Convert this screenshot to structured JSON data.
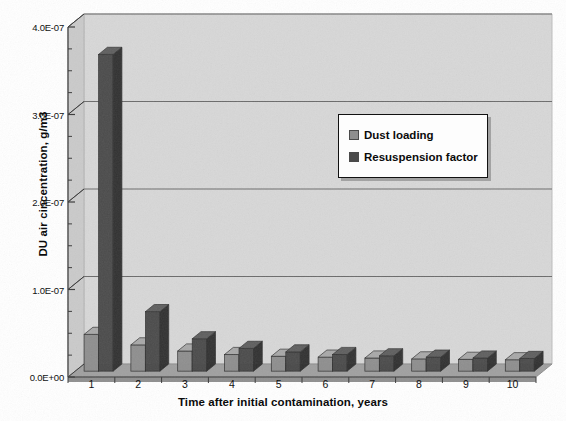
{
  "chart_data": {
    "type": "bar",
    "title": "",
    "xlabel": "Time after initial contamination, years",
    "ylabel": "DU air cincentration, g/m3",
    "categories": [
      "1",
      "2",
      "3",
      "4",
      "5",
      "6",
      "7",
      "8",
      "9",
      "10"
    ],
    "series": [
      {
        "name": "Dust loading",
        "color": "#8e8e8e",
        "values": [
          4.2e-08,
          3e-08,
          2.3e-08,
          1.9e-08,
          1.7e-08,
          1.6e-08,
          1.5e-08,
          1.4e-08,
          1.35e-08,
          1.3e-08
        ]
      },
      {
        "name": "Resuspension factor",
        "color": "#4a4a4a",
        "values": [
          3.62e-07,
          6.8e-08,
          3.7e-08,
          2.6e-08,
          2.2e-08,
          1.9e-08,
          1.75e-08,
          1.6e-08,
          1.5e-08,
          1.45e-08
        ]
      }
    ],
    "ylim": [
      0,
      4e-07
    ],
    "ytick_labels": [
      "4.0E-07",
      "3.0E-07",
      "2.0E-07",
      "1.0E-07",
      "0.0E+00"
    ],
    "ytick_values": [
      4e-07,
      3e-07,
      2e-07,
      1e-07,
      0
    ],
    "minor_tick_step": 2.5e-08,
    "grid": "horizontal-major",
    "legend_position": "upper-right-inside",
    "style": "3d-bar-grayscale"
  },
  "colors": {
    "plot_back_wall": "#d6d6d6",
    "plot_left_wall": "#c9c9c9",
    "plot_floor": "#9e9e9e",
    "floor_front": "#8a8a8a",
    "gridline": "#6a6a6a",
    "axis_line": "#3a3a3a",
    "dust_loading": "#8e8e8e",
    "dust_loading_side": "#6f6f6f",
    "dust_loading_top": "#a8a8a8",
    "resuspension": "#4a4a4a",
    "resuspension_side": "#303030",
    "resuspension_top": "#5e5e5e",
    "text": "#111111",
    "legend_bg": "#fdfdfd",
    "legend_border": "#111111"
  },
  "legend": {
    "items": [
      {
        "label": "Dust loading",
        "swatch": "#8e8e8e"
      },
      {
        "label": "Resuspension factor",
        "swatch": "#4a4a4a"
      }
    ]
  }
}
